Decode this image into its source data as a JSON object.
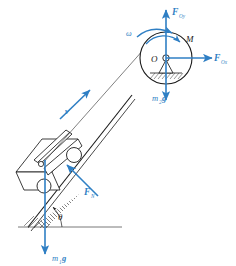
{
  "figure": {
    "type": "free-body-diagram",
    "background_color": "#ffffff",
    "accent_color": "#2f7fc4",
    "line_color": "#1a1a1a"
  },
  "labels": {
    "pulley_vertical_force": "F",
    "pulley_vertical_force_sub": "Oy",
    "pulley_horizontal_force": "F",
    "pulley_horizontal_force_sub": "Ox",
    "moment": "M",
    "angular_velocity": "ω",
    "pulley_weight": "m",
    "pulley_weight_sub": "2",
    "pulley_weight_unit": "g",
    "pulley_center": "O",
    "normal_force": "F",
    "normal_force_sub": "N",
    "block_weight": "m",
    "block_weight_sub": "1",
    "block_weight_unit": "g",
    "velocity": "v",
    "incline_angle": "θ"
  },
  "geometry": {
    "pulley": {
      "cx": 166,
      "cy": 58,
      "r": 26,
      "hub_r": 3.2
    },
    "incline_angle_degrees": 42,
    "ground_line_y": 227,
    "cord_start": {
      "x": 46,
      "y": 163
    },
    "cord_end": {
      "x": 152,
      "y": 40
    }
  },
  "vectors": [
    {
      "name": "F_Oy",
      "direction": "up",
      "from": [
        166,
        58
      ],
      "to": [
        166,
        8
      ]
    },
    {
      "name": "F_Ox",
      "direction": "right",
      "from": [
        166,
        58
      ],
      "to": [
        216,
        58
      ]
    },
    {
      "name": "m2g",
      "direction": "down",
      "from": [
        166,
        58
      ],
      "to": [
        166,
        103
      ]
    },
    {
      "name": "F_N",
      "direction": "down-right",
      "from": [
        66,
        164
      ],
      "to": [
        98,
        196
      ]
    },
    {
      "name": "m1g",
      "direction": "down",
      "from": [
        45,
        163
      ],
      "to": [
        45,
        258
      ]
    },
    {
      "name": "v",
      "direction": "up-incline",
      "from": [
        62,
        117
      ],
      "to": [
        92,
        88
      ]
    },
    {
      "name": "omega",
      "direction": "curved-clockwise",
      "pivot": [
        166,
        58
      ]
    }
  ]
}
